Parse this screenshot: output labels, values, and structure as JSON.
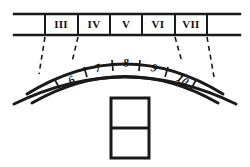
{
  "figure": {
    "title": "",
    "background_color": "#ffffff",
    "line_color": "#1a1a1a",
    "text_color": "#121212"
  },
  "upper_band": {
    "name": "horizontal-band",
    "left_edge_x": 14,
    "right_edge_x": 240,
    "top_y": 14,
    "bottom_y": 35,
    "dividers_x": [
      45,
      78,
      110,
      142,
      175,
      207
    ],
    "cells": [
      {
        "label": "III",
        "center_x": 61
      },
      {
        "label": "IV",
        "center_x": 94
      },
      {
        "label": "V",
        "center_x": 126
      },
      {
        "label": "VI",
        "center_x": 158
      },
      {
        "label": "VII",
        "center_x": 191
      }
    ]
  },
  "dashed_connectors": [
    {
      "name": "connector-iii-left",
      "x1": 45,
      "y1": 37,
      "x2": 39,
      "y2": 74
    },
    {
      "name": "connector-iii-iv",
      "x1": 78,
      "y1": 37,
      "x2": 72,
      "y2": 62
    },
    {
      "name": "connector-vi-vii",
      "x1": 175,
      "y1": 37,
      "x2": 182,
      "y2": 62
    },
    {
      "name": "connector-vii-right",
      "x1": 207,
      "y1": 37,
      "x2": 214,
      "y2": 76
    }
  ],
  "arch": {
    "name": "voussoir-arch",
    "intrados_label": "inner arc",
    "extrados_label": "outer arc",
    "voussoirs": [
      {
        "label": "6",
        "center_x": 72,
        "center_y": 78,
        "rotation": -33
      },
      {
        "label": "7",
        "center_x": 98,
        "center_y": 68,
        "rotation": -19
      },
      {
        "label": "8",
        "center_x": 126,
        "center_y": 64,
        "rotation": -2
      },
      {
        "label": "9",
        "center_x": 155,
        "center_y": 69,
        "rotation": 15
      },
      {
        "label": "10",
        "center_x": 184,
        "center_y": 81,
        "rotation": 31
      }
    ],
    "joint_count": 6
  },
  "block_detail": {
    "name": "two-cell-block",
    "x": 111,
    "y": 98,
    "width": 38,
    "height": 60,
    "rows": 2,
    "divider_y": 128
  }
}
